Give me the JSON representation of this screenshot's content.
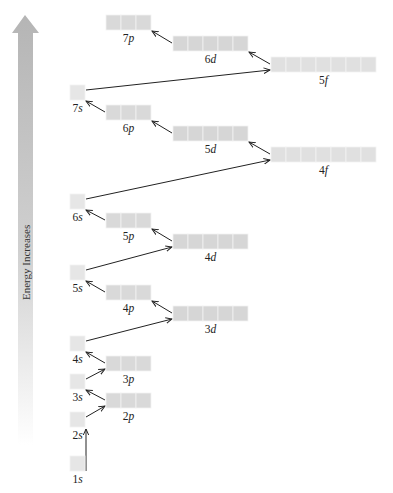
{
  "axis": {
    "label": "Energy Increases",
    "arrow_color_top": "#b8b8b8",
    "arrow_color_bottom": "#ffffff"
  },
  "colors": {
    "s_box": "#e6e6e6",
    "p_box": "#d9d9d9",
    "d_box": "#d6d6d6",
    "f_box": "#e0e0e0",
    "box_divider": "#f2f2f2",
    "arrow": "#222222"
  },
  "orbitals": [
    {
      "id": "1s",
      "n": "1",
      "l": "s",
      "boxes": 1,
      "x": 70,
      "y": 456
    },
    {
      "id": "2s",
      "n": "2",
      "l": "s",
      "boxes": 1,
      "x": 70,
      "y": 412
    },
    {
      "id": "2p",
      "n": "2",
      "l": "p",
      "boxes": 3,
      "x": 106,
      "y": 393
    },
    {
      "id": "3s",
      "n": "3",
      "l": "s",
      "boxes": 1,
      "x": 70,
      "y": 374
    },
    {
      "id": "3p",
      "n": "3",
      "l": "p",
      "boxes": 3,
      "x": 106,
      "y": 356
    },
    {
      "id": "4s",
      "n": "4",
      "l": "s",
      "boxes": 1,
      "x": 70,
      "y": 336
    },
    {
      "id": "3d",
      "n": "3",
      "l": "d",
      "boxes": 5,
      "x": 173,
      "y": 306
    },
    {
      "id": "4p",
      "n": "4",
      "l": "p",
      "boxes": 3,
      "x": 106,
      "y": 285
    },
    {
      "id": "5s",
      "n": "5",
      "l": "s",
      "boxes": 1,
      "x": 70,
      "y": 265
    },
    {
      "id": "4d",
      "n": "4",
      "l": "d",
      "boxes": 5,
      "x": 173,
      "y": 234
    },
    {
      "id": "5p",
      "n": "5",
      "l": "p",
      "boxes": 3,
      "x": 106,
      "y": 213
    },
    {
      "id": "6s",
      "n": "6",
      "l": "s",
      "boxes": 1,
      "x": 70,
      "y": 194
    },
    {
      "id": "4f",
      "n": "4",
      "l": "f",
      "boxes": 7,
      "x": 271,
      "y": 147
    },
    {
      "id": "5d",
      "n": "5",
      "l": "d",
      "boxes": 5,
      "x": 173,
      "y": 126
    },
    {
      "id": "6p",
      "n": "6",
      "l": "p",
      "boxes": 3,
      "x": 106,
      "y": 105
    },
    {
      "id": "7s",
      "n": "7",
      "l": "s",
      "boxes": 1,
      "x": 70,
      "y": 85
    },
    {
      "id": "5f",
      "n": "5",
      "l": "f",
      "boxes": 7,
      "x": 271,
      "y": 57
    },
    {
      "id": "6d",
      "n": "6",
      "l": "d",
      "boxes": 5,
      "x": 173,
      "y": 36
    },
    {
      "id": "7p",
      "n": "7",
      "l": "p",
      "boxes": 3,
      "x": 106,
      "y": 15
    }
  ],
  "fill_order": [
    "1s",
    "2s",
    "2p",
    "3s",
    "3p",
    "4s",
    "3d",
    "4p",
    "5s",
    "4d",
    "5p",
    "6s",
    "4f",
    "5d",
    "6p",
    "7s",
    "5f",
    "6d",
    "7p"
  ],
  "box_size": {
    "w": 15,
    "h": 15
  }
}
